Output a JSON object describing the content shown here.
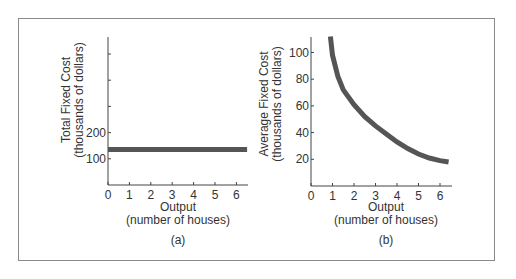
{
  "chart_data": [
    {
      "type": "line",
      "panel_label": "(a)",
      "title": "",
      "xlabel_line1": "Output",
      "xlabel_line2": "(number of houses)",
      "ylabel_line1": "Total Fixed Cost",
      "ylabel_line2": "(thousands of dollars)",
      "x_ticks": [
        "0",
        "1",
        "2",
        "3",
        "4",
        "5",
        "6"
      ],
      "y_ticks": [
        "100",
        "200"
      ],
      "y_unlabeled_ticks": [
        300,
        400,
        500
      ],
      "xlim": [
        0,
        6.5
      ],
      "ylim": [
        0,
        560
      ],
      "grid": false,
      "series": [
        {
          "name": "Total Fixed Cost",
          "x": [
            0,
            6.5
          ],
          "y": [
            135,
            135
          ]
        }
      ]
    },
    {
      "type": "line",
      "panel_label": "(b)",
      "title": "",
      "xlabel_line1": "Output",
      "xlabel_line2": "(number of houses)",
      "ylabel_line1": "Average Fixed Cost",
      "ylabel_line2": "(thousands of dollars)",
      "x_ticks": [
        "0",
        "1",
        "2",
        "3",
        "4",
        "5",
        "6"
      ],
      "y_ticks": [
        "20",
        "40",
        "60",
        "80",
        "100"
      ],
      "xlim": [
        0,
        6.5
      ],
      "ylim": [
        0,
        112
      ],
      "grid": false,
      "series": [
        {
          "name": "Average Fixed Cost",
          "x": [
            0.9,
            1.0,
            1.25,
            1.5,
            2.0,
            2.5,
            3.0,
            3.5,
            4.0,
            4.5,
            5.0,
            5.5,
            6.0,
            6.4
          ],
          "y": [
            112,
            98,
            82,
            72,
            61,
            52,
            45,
            39,
            33,
            28,
            24,
            21,
            19,
            18
          ]
        }
      ]
    }
  ]
}
